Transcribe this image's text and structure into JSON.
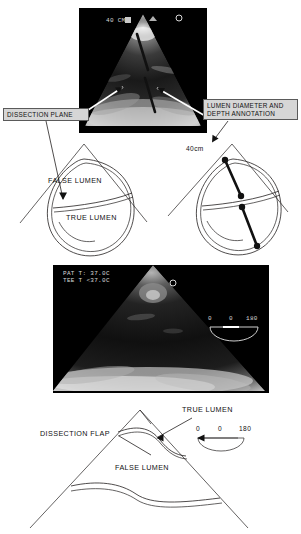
{
  "figure": {
    "type": "transesophageal-echocardiography-composite",
    "panels": [
      {
        "id": "us-panel-1",
        "kind": "ultrasound-image",
        "overlay_text": "40 CM",
        "annotations": [
          "lumen-diameter-caliper-line",
          "dissection-plane-arrow",
          "lumen-depth-arrow"
        ]
      },
      {
        "id": "us-panel-2",
        "kind": "ultrasound-image",
        "overlay_line_1": "PAT T: 37.0C",
        "overlay_line_2": "TEE T <37.0C",
        "omniplane": {
          "left": "0",
          "center": "0",
          "right": "180"
        }
      }
    ]
  },
  "callouts": {
    "dissection_plane": "DISSECTION PLANE",
    "lumen_depth": "LUMEN DIAMETER AND\nDEPTH ANNOTATION",
    "lumen_depth_line1": "LUMEN DIAMETER AND",
    "lumen_depth_line2": "DEPTH ANNOTATION"
  },
  "diagram_left": {
    "name": "aortic-dissection-cross-section-schematic",
    "false_lumen": "FALSE LUMEN",
    "true_lumen": "TRUE LUMEN"
  },
  "diagram_right": {
    "name": "lumen-depth-measurement-schematic",
    "depth_label": "40cm",
    "caliper_points": 4
  },
  "diagram_bottom": {
    "name": "longitudinal-dissection-flap-schematic",
    "dissection_flap": "DISSECTION FLAP",
    "true_lumen": "TRUE LUMEN",
    "false_lumen": "FALSE LUMEN",
    "omniplane": {
      "left": "0",
      "center": "0",
      "right": "180"
    }
  },
  "colors": {
    "ink": "#231f20",
    "callout_fill": "#d6d6d6",
    "callout_border": "#5a5a5a",
    "ultrasound_background": "#000000",
    "ultrasound_text": "#d8d8d8"
  }
}
